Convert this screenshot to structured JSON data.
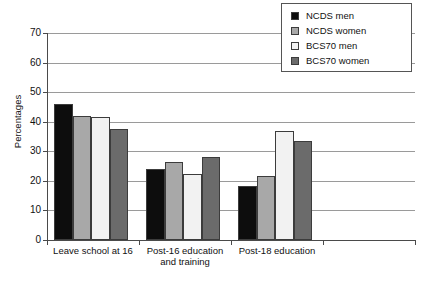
{
  "chart_data": {
    "type": "bar",
    "title": "",
    "xlabel": "",
    "ylabel": "Percentages",
    "ylim": [
      0,
      70
    ],
    "yticks": [
      0,
      10,
      20,
      30,
      40,
      50,
      60,
      70
    ],
    "ytick_labels": [
      "0",
      "10",
      "20",
      "30",
      "40",
      "50",
      "60",
      "70"
    ],
    "grid": true,
    "legend_position": "top-right",
    "categories": [
      "Leave school at 16",
      "Post-16 education and training",
      "Post-18 education"
    ],
    "category_lines": [
      [
        "Leave school at 16"
      ],
      [
        "Post-16 education",
        "and training"
      ],
      [
        "Post-18 education"
      ]
    ],
    "series": [
      {
        "name": "NCDS men",
        "color": "#0d0d0d",
        "values": [
          46.0,
          24.0,
          18.2
        ]
      },
      {
        "name": "NCDS women",
        "color": "#a8a8a8",
        "values": [
          42.0,
          26.5,
          21.7
        ]
      },
      {
        "name": "BCS70 men",
        "color": "#f2f2f2",
        "values": [
          41.5,
          22.2,
          37.0
        ]
      },
      {
        "name": "BCS70 women",
        "color": "#6b6b6b",
        "values": [
          37.5,
          28.2,
          33.5
        ]
      }
    ]
  },
  "legend": {
    "entries": [
      {
        "label": "NCDS men"
      },
      {
        "label": "NCDS women"
      },
      {
        "label": "BCS70 men"
      },
      {
        "label": "BCS70 women"
      }
    ]
  },
  "colors": {
    "axis": "#4a4a4a",
    "grid": "#9a9a9a",
    "bar_border": "#3c3c3c",
    "text": "#111111",
    "background": "#ffffff"
  }
}
